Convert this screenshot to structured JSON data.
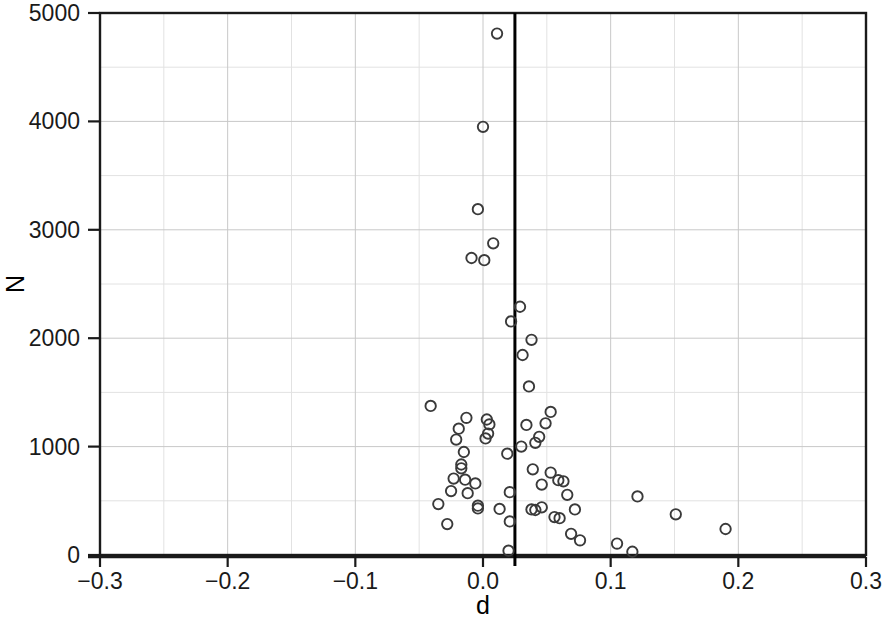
{
  "chart_data": {
    "type": "scatter",
    "title": "",
    "xlabel": "d",
    "ylabel": "N",
    "xlim": [
      -0.3,
      0.3
    ],
    "ylim": [
      0,
      5000
    ],
    "x_ticks": [
      -0.3,
      -0.2,
      -0.1,
      0.0,
      0.1,
      0.2,
      0.3
    ],
    "x_tick_labels": [
      "−0.3",
      "−0.2",
      "−0.1",
      "0.0",
      "0.1",
      "0.2",
      "0.3"
    ],
    "y_ticks": [
      0,
      1000,
      2000,
      3000,
      4000,
      5000
    ],
    "y_tick_labels": [
      "0",
      "1000",
      "2000",
      "3000",
      "4000",
      "5000"
    ],
    "x_minor_step": 0.05,
    "y_minor_step": 500,
    "grid": true,
    "legend": "none",
    "marker": "open-circle",
    "marker_color": "#3a3a3a",
    "annotations": [
      {
        "name": "vertical-reference-line",
        "orientation": "vertical",
        "x": 0.025,
        "color": "#000000"
      }
    ],
    "points": [
      {
        "d": 0.011,
        "N": 4810
      },
      {
        "d": 0.0,
        "N": 3950
      },
      {
        "d": -0.004,
        "N": 3190
      },
      {
        "d": 0.008,
        "N": 2875
      },
      {
        "d": -0.009,
        "N": 2740
      },
      {
        "d": 0.001,
        "N": 2720
      },
      {
        "d": 0.029,
        "N": 2290
      },
      {
        "d": 0.022,
        "N": 2155
      },
      {
        "d": 0.038,
        "N": 1985
      },
      {
        "d": 0.031,
        "N": 1845
      },
      {
        "d": 0.036,
        "N": 1555
      },
      {
        "d": -0.041,
        "N": 1375
      },
      {
        "d": 0.053,
        "N": 1320
      },
      {
        "d": -0.013,
        "N": 1265
      },
      {
        "d": 0.003,
        "N": 1250
      },
      {
        "d": 0.049,
        "N": 1215
      },
      {
        "d": 0.005,
        "N": 1205
      },
      {
        "d": 0.034,
        "N": 1200
      },
      {
        "d": -0.019,
        "N": 1165
      },
      {
        "d": 0.004,
        "N": 1120
      },
      {
        "d": 0.044,
        "N": 1090
      },
      {
        "d": 0.002,
        "N": 1075
      },
      {
        "d": -0.021,
        "N": 1065
      },
      {
        "d": 0.041,
        "N": 1035
      },
      {
        "d": 0.03,
        "N": 1000
      },
      {
        "d": -0.015,
        "N": 950
      },
      {
        "d": 0.019,
        "N": 935
      },
      {
        "d": -0.017,
        "N": 835
      },
      {
        "d": -0.017,
        "N": 800
      },
      {
        "d": 0.039,
        "N": 790
      },
      {
        "d": 0.053,
        "N": 760
      },
      {
        "d": -0.023,
        "N": 705
      },
      {
        "d": -0.014,
        "N": 695
      },
      {
        "d": 0.059,
        "N": 690
      },
      {
        "d": 0.063,
        "N": 680
      },
      {
        "d": -0.006,
        "N": 660
      },
      {
        "d": 0.046,
        "N": 650
      },
      {
        "d": -0.025,
        "N": 590
      },
      {
        "d": 0.021,
        "N": 580
      },
      {
        "d": -0.012,
        "N": 570
      },
      {
        "d": 0.066,
        "N": 555
      },
      {
        "d": 0.121,
        "N": 540
      },
      {
        "d": -0.035,
        "N": 470
      },
      {
        "d": -0.004,
        "N": 455
      },
      {
        "d": -0.004,
        "N": 430
      },
      {
        "d": 0.013,
        "N": 425
      },
      {
        "d": 0.038,
        "N": 420
      },
      {
        "d": 0.041,
        "N": 415
      },
      {
        "d": 0.046,
        "N": 440
      },
      {
        "d": 0.072,
        "N": 420
      },
      {
        "d": 0.151,
        "N": 375
      },
      {
        "d": 0.056,
        "N": 350
      },
      {
        "d": 0.06,
        "N": 340
      },
      {
        "d": 0.021,
        "N": 310
      },
      {
        "d": -0.028,
        "N": 285
      },
      {
        "d": 0.19,
        "N": 240
      },
      {
        "d": 0.069,
        "N": 195
      },
      {
        "d": 0.076,
        "N": 135
      },
      {
        "d": 0.105,
        "N": 105
      },
      {
        "d": 0.02,
        "N": 40
      },
      {
        "d": 0.117,
        "N": 30
      }
    ]
  }
}
